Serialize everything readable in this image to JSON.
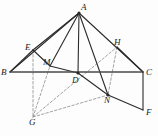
{
  "figure": {
    "type": "geometry-diagram",
    "canvas": {
      "width": 158,
      "height": 136
    },
    "style": {
      "solid_stroke": "#2b2b2b",
      "dashed_stroke": "#8c8c8c",
      "baseline_stroke": "#4a4a4a",
      "background": "#fdfdfd",
      "solid_width": 1.1,
      "dashed_width": 0.8,
      "baseline_width": 1.4,
      "dash_pattern": "2.5,2"
    },
    "points": [
      {
        "id": "A",
        "label": "A",
        "x": 79,
        "y": 13,
        "label_x": 81,
        "label_y": 3,
        "marked": true
      },
      {
        "id": "B",
        "label": "B",
        "x": 10,
        "y": 72,
        "label_x": 1,
        "label_y": 68,
        "marked": false
      },
      {
        "id": "C",
        "label": "C",
        "x": 143,
        "y": 72,
        "label_x": 146,
        "label_y": 68,
        "marked": false
      },
      {
        "id": "D",
        "label": "D",
        "x": 78,
        "y": 73,
        "label_x": 72,
        "label_y": 76,
        "marked": true
      },
      {
        "id": "E",
        "label": "E",
        "x": 33,
        "y": 50,
        "label_x": 25,
        "label_y": 43,
        "marked": false
      },
      {
        "id": "F",
        "label": "F",
        "x": 143,
        "y": 110,
        "label_x": 146,
        "label_y": 108,
        "marked": false
      },
      {
        "id": "G",
        "label": "G",
        "x": 33,
        "y": 117,
        "label_x": 29,
        "label_y": 118,
        "marked": false
      },
      {
        "id": "H",
        "label": "H",
        "x": 117,
        "y": 47,
        "label_x": 114,
        "label_y": 38,
        "marked": false
      },
      {
        "id": "M",
        "label": "M",
        "x": 50,
        "y": 66,
        "label_x": 43,
        "label_y": 58,
        "marked": false
      },
      {
        "id": "N",
        "label": "N",
        "x": 108,
        "y": 95,
        "label_x": 104,
        "label_y": 96,
        "marked": true
      }
    ],
    "solid_segments": [
      {
        "name": "segment-A-B",
        "from": "A",
        "to": "B"
      },
      {
        "name": "segment-A-C",
        "from": "A",
        "to": "C"
      },
      {
        "name": "segment-A-D",
        "from": "A",
        "to": "D"
      },
      {
        "name": "segment-A-M",
        "from": "A",
        "to": "M"
      },
      {
        "name": "segment-A-N",
        "from": "A",
        "to": "N"
      },
      {
        "name": "segment-B-E",
        "from": "B",
        "to": "E"
      },
      {
        "name": "segment-E-A",
        "from": "E",
        "to": "A"
      },
      {
        "name": "segment-E-M",
        "from": "E",
        "to": "M"
      },
      {
        "name": "segment-M-D",
        "from": "M",
        "to": "D"
      },
      {
        "name": "segment-H-C",
        "from": "H",
        "to": "C"
      },
      {
        "name": "segment-D-N",
        "from": "D",
        "to": "N"
      },
      {
        "name": "segment-N-F",
        "from": "N",
        "to": "F"
      },
      {
        "name": "segment-C-F",
        "from": "C",
        "to": "F"
      }
    ],
    "baseline_segment": {
      "name": "segment-B-C-baseline",
      "from": "B",
      "to": "C"
    },
    "dashed_segments": [
      {
        "name": "dashed-E-G",
        "from": "E",
        "to": "G"
      },
      {
        "name": "dashed-H-N",
        "from": "H",
        "to": "N"
      },
      {
        "name": "dashed-G-M",
        "from": "G",
        "to": "M"
      },
      {
        "name": "dashed-G-H",
        "from": "G",
        "to": "H"
      },
      {
        "name": "dashed-G-N",
        "from": "G",
        "to": "N"
      }
    ]
  }
}
